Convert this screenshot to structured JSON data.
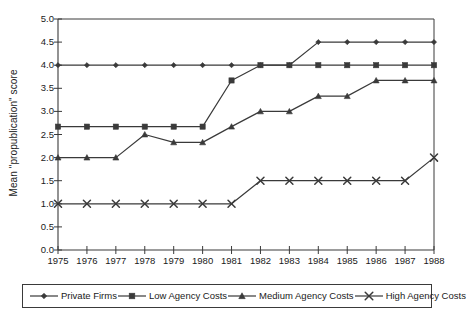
{
  "chart_data": {
    "type": "line",
    "title": "",
    "xlabel": "",
    "ylabel": "Mean \"propublication\" score",
    "x": [
      1975,
      1976,
      1977,
      1978,
      1979,
      1980,
      1981,
      1982,
      1983,
      1984,
      1985,
      1986,
      1987,
      1988
    ],
    "xtick_labels": [
      "1975",
      "1976",
      "1977",
      "1978",
      "1979",
      "1980",
      "1981",
      "1982",
      "1983",
      "1984",
      "1985",
      "1986",
      "1987",
      "1988"
    ],
    "ytick_labels": [
      "0.0",
      "0.5",
      "1.0",
      "1.5",
      "2.0",
      "2.5",
      "3.0",
      "3.5",
      "4.0",
      "4.5",
      "5.0"
    ],
    "ytick_values": [
      0.0,
      0.5,
      1.0,
      1.5,
      2.0,
      2.5,
      3.0,
      3.5,
      4.0,
      4.5,
      5.0
    ],
    "ylim": [
      0.0,
      5.0
    ],
    "xlim": [
      1975,
      1988
    ],
    "grid": false,
    "legend_position": "bottom",
    "line_color": "#3a3a3a",
    "series": [
      {
        "name": "Private Firms",
        "marker": "diamond",
        "color": "#3a3a3a",
        "values": [
          4.0,
          4.0,
          4.0,
          4.0,
          4.0,
          4.0,
          4.0,
          4.0,
          4.0,
          4.5,
          4.5,
          4.5,
          4.5,
          4.5
        ]
      },
      {
        "name": "Low Agency Costs",
        "marker": "square",
        "color": "#3a3a3a",
        "values": [
          2.67,
          2.67,
          2.67,
          2.67,
          2.67,
          2.67,
          3.67,
          4.0,
          4.0,
          4.0,
          4.0,
          4.0,
          4.0,
          4.0
        ]
      },
      {
        "name": "Medium Agency Costs",
        "marker": "triangle",
        "color": "#3a3a3a",
        "values": [
          2.0,
          2.0,
          2.0,
          2.5,
          2.33,
          2.33,
          2.67,
          3.0,
          3.0,
          3.33,
          3.33,
          3.67,
          3.67,
          3.67
        ]
      },
      {
        "name": "High Agency Costs",
        "marker": "cross",
        "color": "#3a3a3a",
        "values": [
          1.0,
          1.0,
          1.0,
          1.0,
          1.0,
          1.0,
          1.0,
          1.5,
          1.5,
          1.5,
          1.5,
          1.5,
          1.5,
          2.0
        ]
      }
    ]
  },
  "legend": {
    "entries": [
      {
        "label": "Private Firms",
        "marker": "diamond"
      },
      {
        "label": "Low Agency Costs",
        "marker": "square"
      },
      {
        "label": "Medium Agency Costs",
        "marker": "triangle"
      },
      {
        "label": "High Agency Costs",
        "marker": "cross"
      }
    ]
  }
}
